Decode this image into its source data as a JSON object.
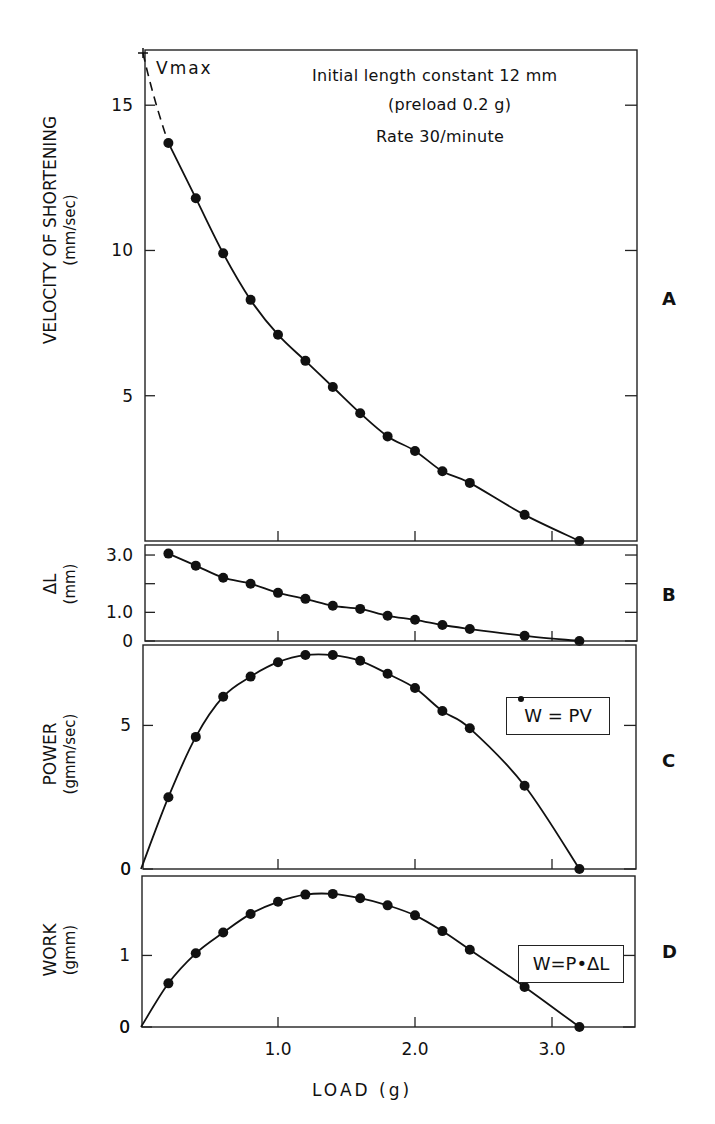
{
  "figure": {
    "annotations": {
      "vmax_label": "Vmax",
      "condition_line1": "Initial length constant 12 mm",
      "condition_line2": "(preload 0.2 g)",
      "condition_line3": "Rate 30/minute"
    },
    "panel_letters": [
      "A",
      "B",
      "C",
      "D"
    ],
    "ylabels": {
      "A_line1": "VELOCITY OF SHORTENING",
      "A_line2": "(mm/sec)",
      "B_line1": "ΔL",
      "B_line2": "(mm)",
      "C_line1": "POWER",
      "C_line2": "(gmm/sec)",
      "D_line1": "WORK",
      "D_line2": "(gmm)"
    },
    "xlabel": "LOAD (g)",
    "equations": {
      "C": "W = PV",
      "D": "W=P•ΔL"
    }
  },
  "chart_data": [
    {
      "panel": "A",
      "type": "line",
      "title": "",
      "xlabel": "LOAD (g)",
      "ylabel": "VELOCITY OF SHORTENING (mm/sec)",
      "x": [
        0.2,
        0.4,
        0.6,
        0.8,
        1.0,
        1.2,
        1.4,
        1.6,
        1.8,
        2.0,
        2.2,
        2.4,
        2.8,
        3.2
      ],
      "series": [
        {
          "name": "Velocity",
          "values": [
            13.7,
            11.8,
            9.9,
            8.3,
            7.1,
            6.2,
            5.3,
            4.4,
            3.6,
            3.1,
            2.4,
            2.0,
            0.9,
            0.0
          ]
        }
      ],
      "extrapolation": {
        "style": "dashed",
        "to": {
          "x": 0.0,
          "y": 16.8,
          "label": "Vmax"
        }
      },
      "yticks": [
        5,
        10,
        15
      ],
      "ylim": [
        0,
        16.9
      ],
      "xlim": [
        0,
        3.6
      ],
      "annotations": [
        "Initial length constant 12 mm",
        "(preload 0.2 g)",
        "Rate 30/minute"
      ],
      "grid": false
    },
    {
      "panel": "B",
      "type": "line",
      "ylabel": "ΔL (mm)",
      "x": [
        0.2,
        0.4,
        0.6,
        0.8,
        1.0,
        1.2,
        1.4,
        1.6,
        1.8,
        2.0,
        2.2,
        2.4,
        2.8,
        3.2
      ],
      "series": [
        {
          "name": "ΔL",
          "values": [
            3.05,
            2.63,
            2.21,
            2.0,
            1.68,
            1.47,
            1.23,
            1.12,
            0.88,
            0.74,
            0.56,
            0.42,
            0.18,
            0.0
          ]
        }
      ],
      "yticks": [
        0,
        1.0,
        2.0,
        3.0
      ],
      "yticklabels": [
        "0",
        "1.0",
        "",
        "3.0"
      ],
      "ylim": [
        0,
        3.35
      ],
      "xlim": [
        0,
        3.6
      ],
      "grid": false
    },
    {
      "panel": "C",
      "type": "line",
      "ylabel": "POWER (gmm/sec)",
      "x": [
        0.0,
        0.2,
        0.4,
        0.6,
        0.8,
        1.0,
        1.2,
        1.4,
        1.6,
        1.8,
        2.0,
        2.2,
        2.4,
        2.8,
        3.2
      ],
      "series": [
        {
          "name": "Power",
          "values": [
            0.0,
            2.5,
            4.6,
            6.0,
            6.7,
            7.2,
            7.45,
            7.45,
            7.25,
            6.8,
            6.3,
            5.5,
            4.9,
            2.9,
            0.0
          ]
        }
      ],
      "point_markers_from_index": 1,
      "yticks": [
        0,
        5
      ],
      "ylim": [
        0,
        7.8
      ],
      "xlim": [
        0,
        3.6
      ],
      "legend": "W = PV",
      "grid": false
    },
    {
      "panel": "D",
      "type": "line",
      "ylabel": "WORK (gmm)",
      "x": [
        0.0,
        0.2,
        0.4,
        0.6,
        0.8,
        1.0,
        1.2,
        1.4,
        1.6,
        1.8,
        2.0,
        2.2,
        2.4,
        2.8,
        3.2
      ],
      "series": [
        {
          "name": "Work",
          "values": [
            0.0,
            0.61,
            1.03,
            1.32,
            1.58,
            1.75,
            1.85,
            1.86,
            1.8,
            1.7,
            1.56,
            1.34,
            1.08,
            0.56,
            0.0
          ]
        }
      ],
      "point_markers_from_index": 1,
      "yticks": [
        0,
        1.0
      ],
      "ylim": [
        0,
        2.11
      ],
      "xlim": [
        0,
        3.6
      ],
      "xticks": [
        1.0,
        2.0,
        3.0
      ],
      "xticklabels": [
        "1.0",
        "2.0",
        "3.0"
      ],
      "legend": "W=P•ΔL",
      "grid": false
    }
  ]
}
